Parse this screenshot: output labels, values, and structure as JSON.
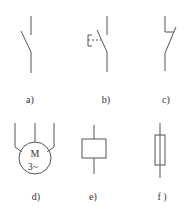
{
  "figure": {
    "symbols": [
      {
        "id": "a",
        "label": "a)",
        "kind": "switch-normally-open"
      },
      {
        "id": "b",
        "label": "b)",
        "kind": "push-button-switch"
      },
      {
        "id": "c",
        "label": "c)",
        "kind": "switch-with-latch"
      },
      {
        "id": "d",
        "label": "d)",
        "kind": "three-phase-motor",
        "text_top": "M",
        "text_bottom": "3~"
      },
      {
        "id": "e",
        "label": "e)",
        "kind": "coil-relay"
      },
      {
        "id": "f",
        "label": "f )",
        "kind": "fuse"
      }
    ],
    "colors": {
      "line": "#555555",
      "text": "#333333",
      "background": "#ffffff"
    }
  }
}
